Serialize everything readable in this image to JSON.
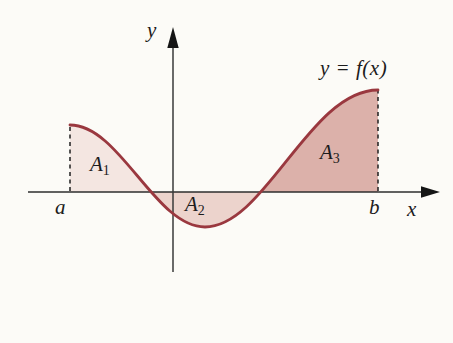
{
  "figure": {
    "curve_label": "y = f(x)",
    "axis_labels": {
      "x": "x",
      "y": "y"
    },
    "interval_labels": {
      "a": "a",
      "b": "b"
    },
    "regions": [
      {
        "base": "A",
        "sub": "1",
        "fill": "#f4e6e1",
        "position": "above-axis-left"
      },
      {
        "base": "A",
        "sub": "2",
        "fill": "#ecd3cc",
        "position": "below-axis-middle"
      },
      {
        "base": "A",
        "sub": "3",
        "fill": "#dcb1aa",
        "position": "above-axis-right"
      }
    ],
    "curve_color": "#9a383f",
    "axis_color": "#2e2e2e",
    "dashed_line_color": "#1f1f1f"
  },
  "caption": {
    "figure_char": "圖",
    "figure_char_icon": "figure-character-icon",
    "number": "14-1-8",
    "color": "#a1353b"
  }
}
